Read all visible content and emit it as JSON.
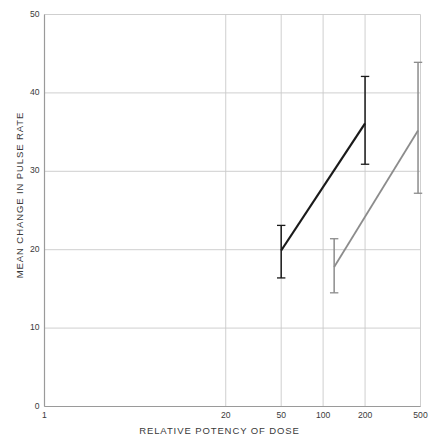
{
  "chart_data": {
    "type": "line",
    "title": "",
    "xlabel": "RELATIVE POTENCY OF DOSE",
    "ylabel": "MEAN CHANGE IN PULSE RATE",
    "xscale": "log",
    "xlim": [
      1,
      500
    ],
    "ylim": [
      0,
      50
    ],
    "xticks": [
      1,
      20,
      50,
      100,
      200,
      500
    ],
    "xtick_labels": [
      "1",
      "20",
      "50",
      "100",
      "200",
      "500"
    ],
    "yticks": [
      0,
      10,
      20,
      30,
      40,
      50
    ],
    "ytick_labels": [
      "0",
      "10",
      "20",
      "30",
      "40",
      "50"
    ],
    "grid": true,
    "legend": "none",
    "series": [
      {
        "name": "series-black",
        "color": "#1a1a1a",
        "linewidth": 2.2,
        "points": [
          {
            "x": 50,
            "y": 19.9,
            "err_low": 16.4,
            "err_high": 23.1
          },
          {
            "x": 200,
            "y": 36.1,
            "err_low": 30.9,
            "err_high": 42.1
          }
        ]
      },
      {
        "name": "series-gray",
        "color": "#8c8c8c",
        "linewidth": 1.8,
        "points": [
          {
            "x": 120,
            "y": 17.8,
            "err_low": 14.5,
            "err_high": 21.4
          },
          {
            "x": 480,
            "y": 35.2,
            "err_low": 27.2,
            "err_high": 43.9
          }
        ]
      }
    ]
  },
  "style": {
    "grid_color": "#c9c9c9",
    "axis_color": "#9a9a9a",
    "text_color": "#3a3a3a",
    "background": "#ffffff"
  }
}
